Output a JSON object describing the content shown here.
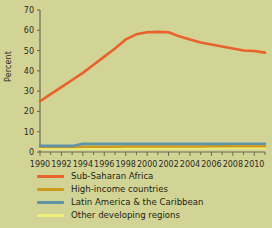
{
  "figure": {
    "background_color": "#d2d495",
    "axis_color": "#6b6b55",
    "text_color": "#2b2b1f"
  },
  "axes": {
    "ylabel": "Percent",
    "yticks": [
      0,
      10,
      20,
      30,
      40,
      50,
      60,
      70
    ],
    "ytick_labels": [
      "0",
      "10",
      "20",
      "30",
      "40",
      "50",
      "60",
      "70"
    ],
    "xticks": [
      1990,
      1992,
      1994,
      1996,
      1998,
      2000,
      2002,
      2004,
      2006,
      2008,
      2010
    ],
    "xtick_labels": [
      "1990",
      "1992",
      "1994",
      "1996",
      "1998",
      "2000",
      "2002",
      "2004",
      "2006",
      "2008",
      "2010"
    ]
  },
  "legend": {
    "items": [
      {
        "label": "Sub-Saharan Africa",
        "color": "#e8622a"
      },
      {
        "label": "High-income countries",
        "color": "#cb9a1e"
      },
      {
        "label": "Latin America & the Caribbean",
        "color": "#5e93a8"
      },
      {
        "label": "Other developing regions",
        "color": "#eeee7a"
      }
    ]
  },
  "chart_data": {
    "type": "line",
    "title": "",
    "xlabel": "",
    "ylabel": "Percent",
    "xlim": [
      1990,
      2011
    ],
    "ylim": [
      0,
      70
    ],
    "grid": false,
    "legend_position": "below",
    "x": [
      1990,
      1991,
      1992,
      1993,
      1994,
      1995,
      1996,
      1997,
      1998,
      1999,
      2000,
      2001,
      2002,
      2003,
      2004,
      2005,
      2006,
      2007,
      2008,
      2009,
      2010,
      2011
    ],
    "series": [
      {
        "name": "Sub-Saharan Africa",
        "color": "#e8622a",
        "values": [
          25.0,
          28.5,
          32.0,
          35.5,
          39.0,
          43.0,
          47.0,
          51.0,
          55.5,
          58.0,
          59.0,
          59.2,
          59.0,
          57.0,
          55.5,
          54.0,
          53.0,
          52.0,
          51.0,
          50.0,
          49.8,
          49.0
        ]
      },
      {
        "name": "High-income countries",
        "color": "#cb9a1e",
        "values": [
          2.5,
          2.5,
          2.5,
          2.5,
          2.6,
          2.6,
          2.6,
          2.6,
          2.7,
          2.7,
          2.7,
          2.7,
          2.7,
          2.7,
          2.7,
          2.7,
          2.8,
          2.8,
          2.8,
          2.8,
          2.8,
          2.8
        ]
      },
      {
        "name": "Latin America & the Caribbean",
        "color": "#5e93a8",
        "values": [
          3.0,
          3.0,
          3.0,
          3.0,
          4.0,
          4.0,
          4.0,
          4.0,
          4.0,
          4.0,
          4.0,
          4.0,
          4.0,
          4.0,
          4.0,
          4.0,
          4.0,
          4.0,
          4.1,
          4.1,
          4.1,
          4.1
        ]
      },
      {
        "name": "Other developing regions",
        "color": "#eeee7a",
        "values": [
          1.6,
          1.6,
          1.6,
          1.6,
          1.7,
          1.7,
          1.7,
          1.7,
          1.8,
          1.8,
          1.8,
          1.8,
          1.8,
          1.9,
          1.9,
          1.9,
          1.9,
          2.0,
          2.0,
          2.0,
          2.0,
          2.0
        ]
      }
    ]
  }
}
